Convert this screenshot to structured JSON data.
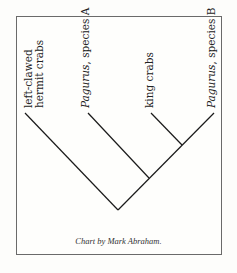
{
  "diagram": {
    "type": "cladogram",
    "taxa": [
      {
        "line1": "left-clawed",
        "line2": "hermit crabs"
      },
      {
        "italic": "Pagurus",
        "rest": ", species A"
      },
      {
        "line1": "king crabs"
      },
      {
        "italic": "Pagurus",
        "rest": ", species B"
      }
    ],
    "credit": "Chart by Mark Abraham.",
    "line_color": "#1a1a1a",
    "frame_color": "#6a6a6a"
  }
}
